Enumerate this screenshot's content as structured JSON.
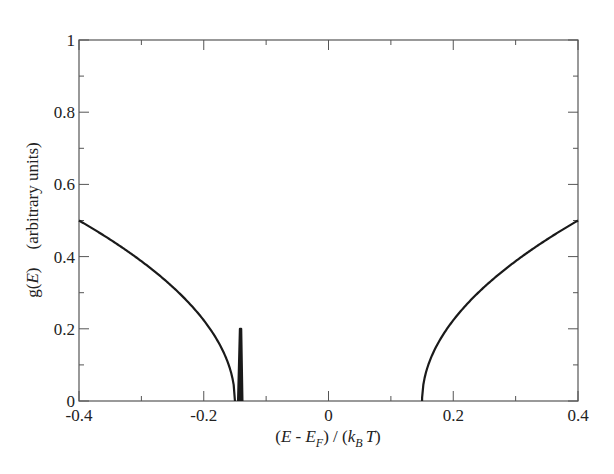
{
  "chart_data": {
    "type": "line",
    "title": "",
    "xlabel": "(E - E_F) / (k_B T)",
    "xlabel_parts": {
      "open": "(",
      "E": "E",
      "minus": " - ",
      "EF": "E",
      "F": "F",
      "mid": ") / (",
      "k": "k",
      "B": "B",
      "T": "T",
      "close": ")"
    },
    "ylabel": "g(E)    (arbitrary units)",
    "ylabel_parts": {
      "g": "g(",
      "E": "E",
      "close": ")",
      "units": "(arbitrary units)"
    },
    "xlim": [
      -0.4,
      0.4
    ],
    "ylim": [
      0,
      1
    ],
    "x_ticks": [
      -0.4,
      -0.2,
      0,
      0.2,
      0.4
    ],
    "x_tick_labels": [
      "-0.4",
      "-0.2",
      "0",
      "0.2",
      "0.4"
    ],
    "y_ticks": [
      0,
      0.2,
      0.4,
      0.6,
      0.8,
      1
    ],
    "y_tick_labels": [
      "0",
      "0.2",
      "0.4",
      "0.6",
      "0.8",
      "1"
    ],
    "grid": false,
    "legend": null,
    "series": [
      {
        "name": "g(E) left band",
        "x": [
          -0.4,
          -0.35,
          -0.3,
          -0.25,
          -0.2,
          -0.18,
          -0.16,
          -0.155,
          -0.15
        ],
        "y": [
          0.5,
          0.447,
          0.387,
          0.316,
          0.224,
          0.173,
          0.1,
          0.071,
          0.0
        ]
      },
      {
        "name": "in-gap spike",
        "x": [
          -0.145,
          -0.142,
          -0.14,
          -0.138
        ],
        "y": [
          0.0,
          0.2,
          0.2,
          0.0
        ]
      },
      {
        "name": "g(E) right band",
        "x": [
          0.15,
          0.155,
          0.16,
          0.18,
          0.2,
          0.25,
          0.3,
          0.35,
          0.4
        ],
        "y": [
          0.0,
          0.071,
          0.1,
          0.173,
          0.224,
          0.316,
          0.387,
          0.447,
          0.5
        ]
      }
    ],
    "colors": {
      "line": "#1a1a1a",
      "frame": "#555555",
      "text": "#222222"
    }
  }
}
